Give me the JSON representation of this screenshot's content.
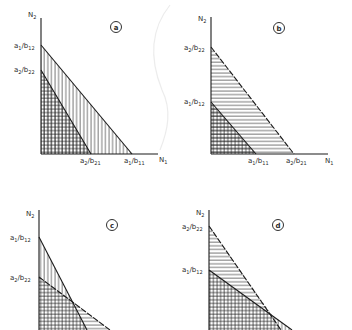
{
  "figure": {
    "panels": [
      {
        "id": "a",
        "badge": "a",
        "y_axis_label": "N",
        "y_axis_sub": "2",
        "x_axis_label": "N",
        "x_axis_sub": "1",
        "y_ticks": [
          {
            "num": "a",
            "num_sub": "1",
            "den": "b",
            "den_sub": "12"
          },
          {
            "num": "a",
            "num_sub": "2",
            "den": "b",
            "den_sub": "22"
          }
        ],
        "x_ticks": [
          {
            "num": "a",
            "num_sub": "2",
            "den": "b",
            "den_sub": "21"
          },
          {
            "num": "a",
            "num_sub": "1",
            "den": "b",
            "den_sub": "11"
          }
        ],
        "description": "Species 1 isocline lies entirely outside species 2 isocline"
      },
      {
        "id": "b",
        "badge": "b",
        "y_axis_label": "N",
        "y_axis_sub": "2",
        "x_axis_label": "N",
        "x_axis_sub": "1",
        "y_ticks": [
          {
            "num": "a",
            "num_sub": "2",
            "den": "b",
            "den_sub": "22"
          },
          {
            "num": "a",
            "num_sub": "1",
            "den": "b",
            "den_sub": "12"
          }
        ],
        "x_ticks": [
          {
            "num": "a",
            "num_sub": "1",
            "den": "b",
            "den_sub": "11"
          },
          {
            "num": "a",
            "num_sub": "2",
            "den": "b",
            "den_sub": "21"
          }
        ],
        "description": "Species 2 isocline lies entirely outside species 1 isocline"
      },
      {
        "id": "c",
        "badge": "c",
        "y_axis_label": "N",
        "y_axis_sub": "2",
        "y_ticks": [
          {
            "num": "a",
            "num_sub": "1",
            "den": "b",
            "den_sub": "12"
          },
          {
            "num": "a",
            "num_sub": "2",
            "den": "b",
            "den_sub": "22"
          }
        ],
        "description": "Isoclines cross; species 1 higher on N2 axis"
      },
      {
        "id": "d",
        "badge": "d",
        "y_axis_label": "N",
        "y_axis_sub": "2",
        "y_ticks": [
          {
            "num": "a",
            "num_sub": "2",
            "den": "b",
            "den_sub": "22"
          },
          {
            "num": "a",
            "num_sub": "1",
            "den": "b",
            "den_sub": "12"
          }
        ],
        "description": "Isoclines cross; species 2 higher on N2 axis"
      }
    ],
    "colors": {
      "ink": "#1a1a1a",
      "hatch": "#333333",
      "background": "#ffffff"
    }
  }
}
